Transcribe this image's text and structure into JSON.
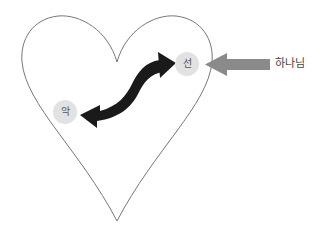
{
  "diagram": {
    "nodes": [
      {
        "id": "good",
        "label": "선"
      },
      {
        "id": "evil",
        "label": "악"
      }
    ],
    "external": {
      "label": "하나님"
    },
    "edges": [
      {
        "from": "good",
        "to": "evil",
        "type": "bidirectional-curved",
        "color": "#1a1a1a"
      },
      {
        "from": "external",
        "to": "good",
        "type": "straight",
        "color": "#8a8a8a"
      }
    ],
    "colors": {
      "heart_stroke": "#777777",
      "node_fill": "#e2e2e2",
      "dark_arrow": "#1a1a1a",
      "gray_arrow": "#8a8a8a"
    }
  }
}
